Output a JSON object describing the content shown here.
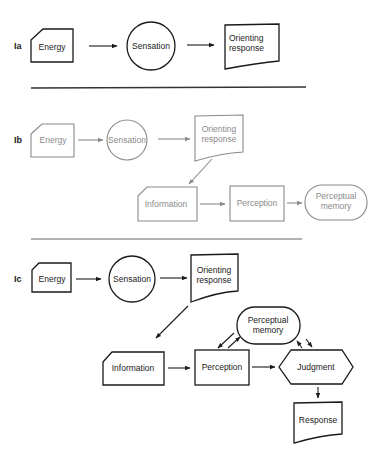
{
  "panels": [
    {
      "id": "Ia",
      "label": "Ia",
      "style": "dark",
      "nodes": {
        "energy": "Energy",
        "sensation": "Sensation",
        "orienting_line1": "Orienting",
        "orienting_line2": "response"
      }
    },
    {
      "id": "Ib",
      "label": "Ib",
      "style": "grey",
      "nodes": {
        "energy": "Energy",
        "sensation": "Sensation",
        "orienting_line1": "Orienting",
        "orienting_line2": "response",
        "information": "Information",
        "perception": "Perception",
        "perceptual_memory_line1": "Perceptual",
        "perceptual_memory_line2": "memory"
      }
    },
    {
      "id": "Ic",
      "label": "Ic",
      "style": "dark",
      "nodes": {
        "energy": "Energy",
        "sensation": "Sensation",
        "orienting_line1": "Orienting",
        "orienting_line2": "response",
        "perceptual_memory_line1": "Perceptual",
        "perceptual_memory_line2": "memory",
        "information": "Information",
        "perception": "Perception",
        "judgment": "Judgment",
        "response": "Response"
      }
    }
  ],
  "colors": {
    "ink_dark": "#1a1a1a",
    "ink_grey": "#8a8a8a",
    "background": "#ffffff"
  }
}
